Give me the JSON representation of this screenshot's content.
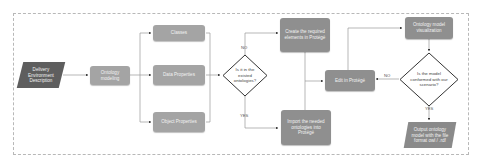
{
  "diagram": {
    "nodes": {
      "input": "Delivery Environment Description",
      "ontology_modeling": "Ontology modeling",
      "classes": "Classes",
      "data_properties": "Data Properties",
      "object_properties": "Object Properties",
      "decision_existing": "Is it in the existed ontologies?",
      "create_elements": "Create the required elements in Protégé",
      "import_ontologies": "Import the needed ontologies into Protégé",
      "edit_protege": "Edit in Protégé",
      "visualization": "Ontology model visualization",
      "decision_conform": "Is the model conformed with our scenario?",
      "output": "Output ontology model with the file format owl / .rdf"
    },
    "edge_labels": {
      "no_existing": "NO",
      "yes_existing": "YES",
      "no_conform": "NO",
      "yes_conform": "YES"
    },
    "colors": {
      "process_box": "#8f8f8f",
      "input_parallelogram": "#5e5e5e",
      "output_parallelogram": "#8a8a8a",
      "connector": "#9a9a9a",
      "frame": "#b8b8b8"
    }
  }
}
